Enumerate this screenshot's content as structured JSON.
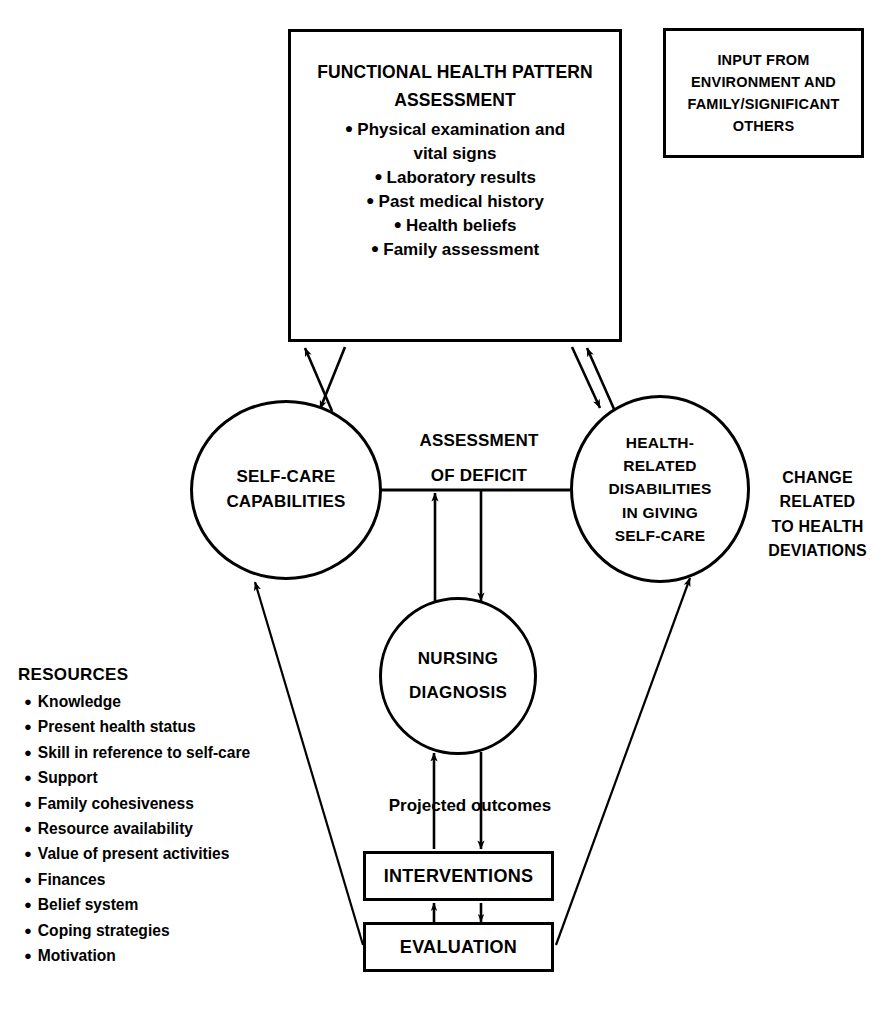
{
  "diagram": {
    "title_visible": false,
    "stroke_color": "#000000",
    "background_color": "#ffffff"
  },
  "assessment_box": {
    "heading_line_1": "FUNCTIONAL HEALTH PATTERN",
    "heading_line_2": "ASSESSMENT",
    "bullet_char": "●",
    "items": [
      "Physical examination and",
      "vital signs",
      "Laboratory results",
      "Past medical history",
      "Health beliefs",
      "Family assessment"
    ],
    "bulleted_flags": [
      true,
      false,
      true,
      true,
      true,
      true
    ]
  },
  "input_box": {
    "lines": [
      "INPUT FROM",
      "ENVIRONMENT AND",
      "FAMILY/SIGNIFICANT",
      "OTHERS"
    ]
  },
  "self_care_circle": {
    "lines": [
      "SELF-CARE",
      "CAPABILITIES"
    ]
  },
  "health_related_circle": {
    "lines": [
      "HEALTH-",
      "RELATED",
      "DISABILITIES",
      "IN GIVING",
      "SELF-CARE"
    ]
  },
  "nursing_circle": {
    "lines": [
      "NURSING",
      "DIAGNOSIS"
    ]
  },
  "assessment_deficit_label": {
    "lines": [
      "ASSESSMENT",
      "OF DEFICIT"
    ]
  },
  "change_label": {
    "lines": [
      "CHANGE",
      "RELATED",
      "TO HEALTH",
      "DEVIATIONS"
    ]
  },
  "projected_outcomes_label": {
    "text": "Projected outcomes"
  },
  "interventions_box": {
    "label": "INTERVENTIONS"
  },
  "evaluation_box": {
    "label": "EVALUATION"
  },
  "resources": {
    "title": "RESOURCES",
    "bullet_char": "●",
    "items": [
      "Knowledge",
      "Present health status",
      "Skill in reference to self-care",
      "Support",
      "Family cohesiveness",
      "Resource availability",
      "Value of present activities",
      "Finances",
      "Belief system",
      "Coping strategies",
      "Motivation"
    ]
  },
  "connectors": [
    {
      "name": "assessment-box-to-self-care-circle",
      "direction": "down"
    },
    {
      "name": "self-care-circle-to-assessment-box",
      "direction": "up"
    },
    {
      "name": "assessment-box-to-health-circle",
      "direction": "down"
    },
    {
      "name": "health-circle-to-assessment-box",
      "direction": "up"
    },
    {
      "name": "self-care-to-health-horizontal",
      "direction": "none"
    },
    {
      "name": "nursing-diagnosis-to-deficit-line",
      "direction": "up"
    },
    {
      "name": "deficit-line-to-nursing-diagnosis",
      "direction": "down"
    },
    {
      "name": "interventions-to-nursing-diagnosis",
      "direction": "up"
    },
    {
      "name": "nursing-diagnosis-to-interventions",
      "direction": "down"
    },
    {
      "name": "evaluation-to-interventions",
      "direction": "up"
    },
    {
      "name": "interventions-to-evaluation",
      "direction": "down"
    },
    {
      "name": "evaluation-to-self-care-circle",
      "direction": "up-left"
    },
    {
      "name": "evaluation-to-health-circle",
      "direction": "up-right"
    }
  ]
}
